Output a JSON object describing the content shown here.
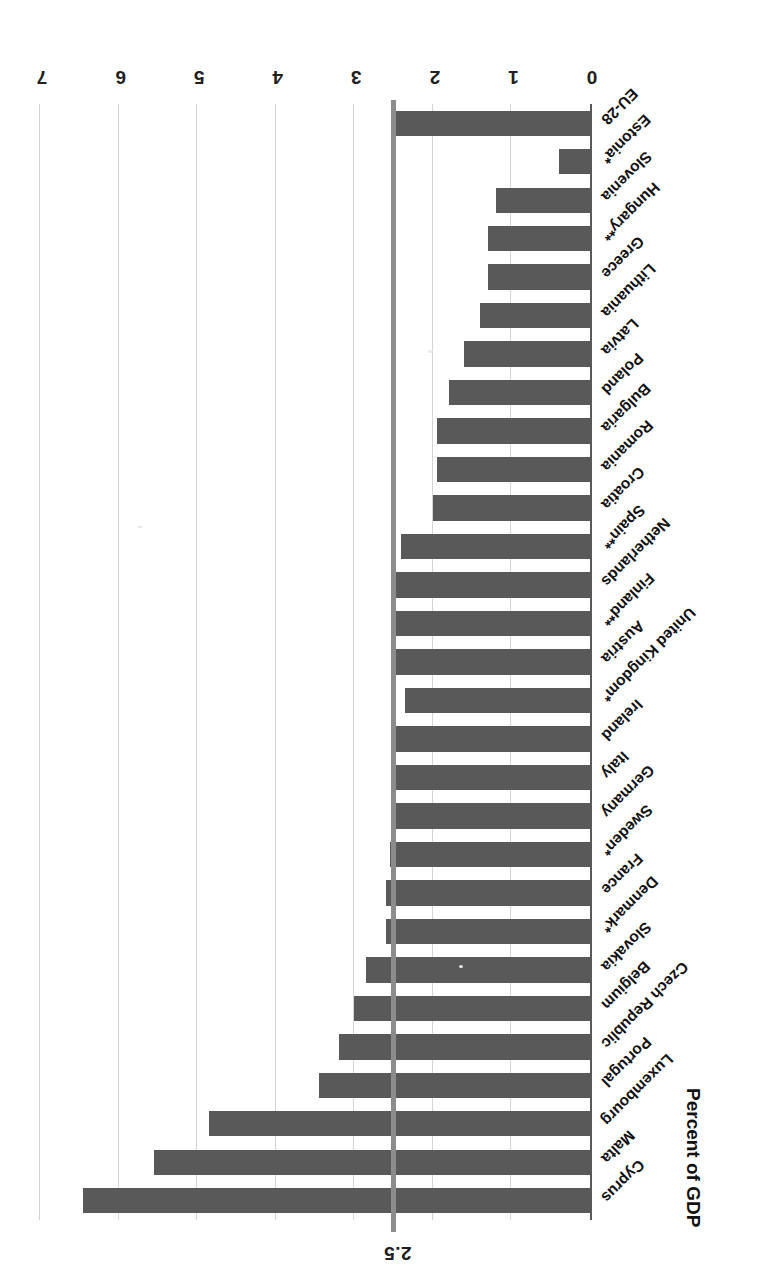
{
  "chart_data": {
    "type": "bar",
    "orientation": "horizontal",
    "title": "",
    "xlabel": "Percent of GDP",
    "ylabel": "",
    "xlim": [
      0,
      7
    ],
    "xticks": [
      "0",
      "1",
      "2",
      "3",
      "4",
      "5",
      "6",
      "7"
    ],
    "grid": true,
    "legend": "none",
    "bar_color": "#595959",
    "reference_line": {
      "value": 2.5,
      "label": "2.5",
      "color": "#8c8c8c"
    },
    "categories": [
      "Cyprus",
      "Malta",
      "Luxembourg",
      "Portugal",
      "Czech Republic",
      "Belgium",
      "Slovakia",
      "Denmark*",
      "France",
      "Sweden*",
      "Germany",
      "Italy",
      "Ireland",
      "United Kingdom*",
      "Austria",
      "Finland**",
      "Netherlands",
      "Spain**",
      "Croatia",
      "Romania",
      "Bulgaria",
      "Poland",
      "Latvia",
      "Lithuania",
      "Greece",
      "Hungary**",
      "Slovenia",
      "Estonia*",
      "EU-28"
    ],
    "values": [
      6.45,
      5.55,
      4.85,
      3.45,
      3.2,
      3.0,
      2.85,
      2.6,
      2.6,
      2.55,
      2.5,
      2.5,
      2.5,
      2.35,
      2.5,
      2.5,
      2.5,
      2.4,
      2.0,
      1.95,
      1.95,
      1.8,
      1.6,
      1.4,
      1.3,
      1.3,
      1.2,
      0.4,
      2.5
    ]
  },
  "axis": {
    "title": "Percent of GDP"
  }
}
